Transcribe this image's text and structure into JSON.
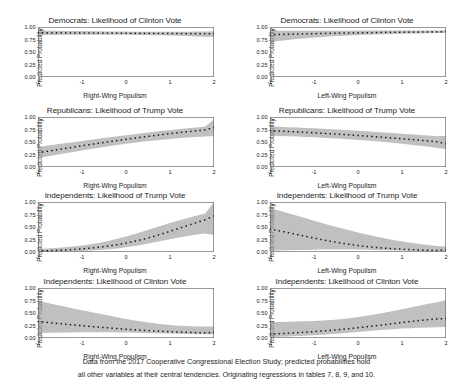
{
  "figure": {
    "width": 453,
    "height": 388,
    "band_color": "#9a9a9a",
    "line_color": "#1a1a1a",
    "frame_color": "#6e6e6e",
    "background": "#ffffff"
  },
  "caption": {
    "line1": "Data from the 2017 Cooperative Congressional Election Study; predicted probabilities hold",
    "line2": "all other variables at their central tendencies. Originating regressions in tables 7, 8, 9, and 10."
  },
  "axis": {
    "ylabel": "Predicted Probability",
    "yticks": [
      "1.00",
      "0.75",
      "0.50",
      "0.25",
      "0.00"
    ],
    "ytickvals": [
      1.0,
      0.75,
      0.5,
      0.25,
      0.0
    ],
    "ylim": [
      0,
      1
    ],
    "xticks": [
      "-2",
      "-1",
      "0",
      "1",
      "2"
    ],
    "xtickvals": [
      -2,
      -1,
      0,
      1,
      2
    ],
    "xlim": [
      -2,
      2
    ],
    "xlabel_right": "Right-Wing Populism",
    "xlabel_left": "Left-Wing Populism"
  },
  "chart_data": [
    {
      "id": "dem-clinton-rwp",
      "type": "line",
      "title": "Democrats: Likelihood of Clinton Vote",
      "xlabel": "Right-Wing Populism",
      "ylabel": "Predicted Probability",
      "xlim": [
        -2,
        2
      ],
      "ylim": [
        0,
        1
      ],
      "grid": false,
      "legend": "none",
      "x": [
        -2,
        -1.8,
        -1.6,
        -1.4,
        -1.2,
        -1,
        -0.8,
        -0.6,
        -0.4,
        -0.2,
        0,
        0.2,
        0.4,
        0.6,
        0.8,
        1,
        1.2,
        1.4,
        1.6,
        1.8,
        2
      ],
      "series": [
        {
          "name": "Predicted probability",
          "style": "dotted-marker",
          "values": [
            0.885,
            0.884,
            0.883,
            0.882,
            0.881,
            0.88,
            0.879,
            0.878,
            0.877,
            0.876,
            0.875,
            0.874,
            0.873,
            0.872,
            0.871,
            0.87,
            0.869,
            0.868,
            0.867,
            0.866,
            0.865
          ]
        },
        {
          "name": "95% CI lower",
          "style": "band",
          "values": [
            0.84,
            0.841,
            0.842,
            0.843,
            0.844,
            0.845,
            0.846,
            0.846,
            0.846,
            0.845,
            0.844,
            0.842,
            0.84,
            0.837,
            0.833,
            0.829,
            0.824,
            0.818,
            0.812,
            0.805,
            0.798
          ]
        },
        {
          "name": "95% CI upper",
          "style": "band",
          "values": [
            0.925,
            0.924,
            0.923,
            0.922,
            0.92,
            0.918,
            0.916,
            0.914,
            0.912,
            0.91,
            0.908,
            0.907,
            0.906,
            0.905,
            0.905,
            0.905,
            0.906,
            0.907,
            0.909,
            0.911,
            0.914
          ]
        }
      ]
    },
    {
      "id": "dem-clinton-lwp",
      "type": "line",
      "title": "Democrats: Likelihood of Clinton Vote",
      "xlabel": "Left-Wing Populism",
      "ylabel": "Predicted Probability",
      "xlim": [
        -2,
        2
      ],
      "ylim": [
        0,
        1
      ],
      "grid": false,
      "legend": "none",
      "x": [
        -2,
        -1.8,
        -1.6,
        -1.4,
        -1.2,
        -1,
        -0.8,
        -0.6,
        -0.4,
        -0.2,
        0,
        0.2,
        0.4,
        0.6,
        0.8,
        1,
        1.2,
        1.4,
        1.6,
        1.8,
        2
      ],
      "series": [
        {
          "name": "Predicted probability",
          "style": "dotted-marker",
          "values": [
            0.845,
            0.85,
            0.855,
            0.859,
            0.863,
            0.867,
            0.871,
            0.874,
            0.877,
            0.88,
            0.883,
            0.886,
            0.888,
            0.891,
            0.893,
            0.895,
            0.897,
            0.899,
            0.901,
            0.903,
            0.905
          ]
        },
        {
          "name": "95% CI lower",
          "style": "band",
          "values": [
            0.7,
            0.722,
            0.742,
            0.76,
            0.776,
            0.79,
            0.802,
            0.813,
            0.822,
            0.83,
            0.838,
            0.845,
            0.851,
            0.856,
            0.861,
            0.865,
            0.869,
            0.872,
            0.875,
            0.878,
            0.88
          ]
        },
        {
          "name": "95% CI upper",
          "style": "band",
          "values": [
            0.925,
            0.925,
            0.925,
            0.925,
            0.925,
            0.925,
            0.926,
            0.926,
            0.927,
            0.927,
            0.928,
            0.928,
            0.929,
            0.929,
            0.93,
            0.93,
            0.931,
            0.931,
            0.932,
            0.932,
            0.933
          ]
        }
      ]
    },
    {
      "id": "rep-trump-rwp",
      "type": "line",
      "title": "Republicans: Likelihood of Trump Vote",
      "xlabel": "Right-Wing Populism",
      "ylabel": "Predicted Probability",
      "xlim": [
        -2,
        2
      ],
      "ylim": [
        0,
        1
      ],
      "grid": false,
      "legend": "none",
      "x": [
        -2,
        -1.8,
        -1.6,
        -1.4,
        -1.2,
        -1,
        -0.8,
        -0.6,
        -0.4,
        -0.2,
        0,
        0.2,
        0.4,
        0.6,
        0.8,
        1,
        1.2,
        1.4,
        1.6,
        1.8,
        2
      ],
      "series": [
        {
          "name": "Predicted probability",
          "style": "dotted-marker",
          "values": [
            0.285,
            0.313,
            0.341,
            0.369,
            0.397,
            0.425,
            0.452,
            0.478,
            0.504,
            0.529,
            0.554,
            0.578,
            0.601,
            0.624,
            0.646,
            0.667,
            0.687,
            0.706,
            0.724,
            0.742,
            0.79
          ]
        },
        {
          "name": "95% CI lower",
          "style": "band",
          "values": [
            0.18,
            0.21,
            0.24,
            0.27,
            0.3,
            0.33,
            0.359,
            0.387,
            0.414,
            0.44,
            0.464,
            0.487,
            0.508,
            0.527,
            0.545,
            0.561,
            0.576,
            0.589,
            0.601,
            0.611,
            0.62
          ]
        },
        {
          "name": "95% CI upper",
          "style": "band",
          "values": [
            0.4,
            0.424,
            0.449,
            0.473,
            0.497,
            0.521,
            0.545,
            0.568,
            0.591,
            0.613,
            0.635,
            0.657,
            0.678,
            0.699,
            0.719,
            0.738,
            0.757,
            0.775,
            0.792,
            0.809,
            0.95
          ]
        }
      ]
    },
    {
      "id": "rep-trump-lwp",
      "type": "line",
      "title": "Republicans: Likelihood of Trump Vote",
      "xlabel": "Left-Wing Populism",
      "ylabel": "Predicted Probability",
      "xlim": [
        -2,
        2
      ],
      "ylim": [
        0,
        1
      ],
      "grid": false,
      "legend": "none",
      "x": [
        -2,
        -1.8,
        -1.6,
        -1.4,
        -1.2,
        -1,
        -0.8,
        -0.6,
        -0.4,
        -0.2,
        0,
        0.2,
        0.4,
        0.6,
        0.8,
        1,
        1.2,
        1.4,
        1.6,
        1.8,
        2
      ],
      "series": [
        {
          "name": "Predicted probability",
          "style": "dotted-marker",
          "values": [
            0.725,
            0.718,
            0.71,
            0.702,
            0.693,
            0.684,
            0.674,
            0.664,
            0.653,
            0.642,
            0.63,
            0.618,
            0.605,
            0.592,
            0.578,
            0.564,
            0.55,
            0.535,
            0.52,
            0.505,
            0.462
          ]
        },
        {
          "name": "95% CI lower",
          "style": "band",
          "values": [
            0.625,
            0.62,
            0.614,
            0.608,
            0.601,
            0.593,
            0.585,
            0.575,
            0.565,
            0.554,
            0.542,
            0.528,
            0.514,
            0.498,
            0.481,
            0.463,
            0.444,
            0.424,
            0.403,
            0.382,
            0.36
          ]
        },
        {
          "name": "95% CI upper",
          "style": "band",
          "values": [
            0.81,
            0.803,
            0.796,
            0.789,
            0.781,
            0.773,
            0.764,
            0.755,
            0.745,
            0.735,
            0.724,
            0.713,
            0.702,
            0.69,
            0.678,
            0.666,
            0.654,
            0.641,
            0.629,
            0.617,
            0.625
          ]
        }
      ]
    },
    {
      "id": "ind-trump-rwp",
      "type": "line",
      "title": "Independents: Likelihood of Trump Vote",
      "xlabel": "Right-Wing Populism",
      "ylabel": "Predicted Probability",
      "xlim": [
        -2,
        2
      ],
      "ylim": [
        0,
        1
      ],
      "grid": false,
      "legend": "none",
      "x": [
        -2,
        -1.8,
        -1.6,
        -1.4,
        -1.2,
        -1,
        -0.8,
        -0.6,
        -0.4,
        -0.2,
        0,
        0.2,
        0.4,
        0.6,
        0.8,
        1,
        1.2,
        1.4,
        1.6,
        1.8,
        2
      ],
      "series": [
        {
          "name": "Predicted probability",
          "style": "dotted-marker",
          "values": [
            0.02,
            0.025,
            0.032,
            0.04,
            0.05,
            0.063,
            0.078,
            0.097,
            0.119,
            0.146,
            0.178,
            0.215,
            0.257,
            0.305,
            0.357,
            0.413,
            0.471,
            0.53,
            0.588,
            0.645,
            0.72
          ]
        },
        {
          "name": "95% CI lower",
          "style": "band",
          "values": [
            0.0,
            0.002,
            0.005,
            0.009,
            0.014,
            0.02,
            0.029,
            0.04,
            0.054,
            0.072,
            0.094,
            0.12,
            0.15,
            0.183,
            0.218,
            0.254,
            0.289,
            0.322,
            0.35,
            0.372,
            0.34
          ]
        },
        {
          "name": "95% CI upper",
          "style": "band",
          "values": [
            0.065,
            0.072,
            0.082,
            0.094,
            0.11,
            0.13,
            0.155,
            0.186,
            0.222,
            0.264,
            0.311,
            0.362,
            0.416,
            0.471,
            0.526,
            0.58,
            0.632,
            0.681,
            0.727,
            0.77,
            1.0
          ]
        }
      ]
    },
    {
      "id": "ind-trump-lwp",
      "type": "line",
      "title": "Independents: Likelihood of Trump Vote",
      "xlabel": "Left-Wing Populism",
      "ylabel": "Predicted Probability",
      "xlim": [
        -2,
        2
      ],
      "ylim": [
        0,
        1
      ],
      "grid": false,
      "legend": "none",
      "x": [
        -2,
        -1.8,
        -1.6,
        -1.4,
        -1.2,
        -1,
        -0.8,
        -0.6,
        -0.4,
        -0.2,
        0,
        0.2,
        0.4,
        0.6,
        0.8,
        1,
        1.2,
        1.4,
        1.6,
        1.8,
        2
      ],
      "series": [
        {
          "name": "Predicted probability",
          "style": "dotted-marker",
          "values": [
            0.46,
            0.425,
            0.39,
            0.352,
            0.315,
            0.278,
            0.243,
            0.21,
            0.18,
            0.153,
            0.129,
            0.109,
            0.091,
            0.077,
            0.065,
            0.055,
            0.047,
            0.04,
            0.034,
            0.03,
            0.04
          ]
        },
        {
          "name": "95% CI lower",
          "style": "band",
          "values": [
            0.03,
            0.032,
            0.035,
            0.038,
            0.042,
            0.046,
            0.049,
            0.051,
            0.052,
            0.051,
            0.049,
            0.046,
            0.042,
            0.037,
            0.032,
            0.028,
            0.024,
            0.02,
            0.017,
            0.014,
            0.012
          ]
        },
        {
          "name": "95% CI upper",
          "style": "band",
          "values": [
            0.88,
            0.83,
            0.78,
            0.729,
            0.678,
            0.627,
            0.576,
            0.527,
            0.479,
            0.433,
            0.39,
            0.348,
            0.31,
            0.274,
            0.242,
            0.212,
            0.186,
            0.162,
            0.141,
            0.122,
            0.11
          ]
        }
      ]
    },
    {
      "id": "ind-clinton-rwp",
      "type": "line",
      "title": "Independents: Likelihood of Clinton Vote",
      "xlabel": "Right-Wing Populism",
      "ylabel": "Predicted Probability",
      "xlim": [
        -2,
        2
      ],
      "ylim": [
        0,
        1
      ],
      "grid": false,
      "legend": "none",
      "x": [
        -2,
        -1.8,
        -1.6,
        -1.4,
        -1.2,
        -1,
        -0.8,
        -0.6,
        -0.4,
        -0.2,
        0,
        0.2,
        0.4,
        0.6,
        0.8,
        1,
        1.2,
        1.4,
        1.6,
        1.8,
        2
      ],
      "series": [
        {
          "name": "Predicted probability",
          "style": "dotted-marker",
          "values": [
            0.33,
            0.312,
            0.295,
            0.278,
            0.262,
            0.246,
            0.231,
            0.216,
            0.202,
            0.189,
            0.176,
            0.164,
            0.153,
            0.143,
            0.134,
            0.126,
            0.119,
            0.113,
            0.108,
            0.104,
            0.11
          ]
        },
        {
          "name": "95% CI lower",
          "style": "band",
          "values": [
            0.1,
            0.103,
            0.106,
            0.109,
            0.111,
            0.113,
            0.114,
            0.114,
            0.113,
            0.111,
            0.108,
            0.105,
            0.101,
            0.097,
            0.092,
            0.088,
            0.084,
            0.08,
            0.076,
            0.073,
            0.07
          ]
        },
        {
          "name": "95% CI upper",
          "style": "band",
          "values": [
            0.74,
            0.703,
            0.666,
            0.629,
            0.592,
            0.556,
            0.52,
            0.484,
            0.449,
            0.415,
            0.382,
            0.351,
            0.323,
            0.298,
            0.277,
            0.26,
            0.247,
            0.238,
            0.232,
            0.229,
            0.228
          ]
        }
      ]
    },
    {
      "id": "ind-clinton-lwp",
      "type": "line",
      "title": "Independents: Likelihood of Clinton Vote",
      "xlabel": "Left-Wing Populism",
      "ylabel": "Predicted Probability",
      "xlim": [
        -2,
        2
      ],
      "ylim": [
        0,
        1
      ],
      "grid": false,
      "legend": "none",
      "x": [
        -2,
        -1.8,
        -1.6,
        -1.4,
        -1.2,
        -1,
        -0.8,
        -0.6,
        -0.4,
        -0.2,
        0,
        0.2,
        0.4,
        0.6,
        0.8,
        1,
        1.2,
        1.4,
        1.6,
        1.8,
        2
      ],
      "series": [
        {
          "name": "Predicted probability",
          "style": "dotted-marker",
          "values": [
            0.078,
            0.086,
            0.095,
            0.105,
            0.116,
            0.128,
            0.141,
            0.155,
            0.171,
            0.188,
            0.206,
            0.225,
            0.245,
            0.266,
            0.288,
            0.31,
            0.331,
            0.35,
            0.367,
            0.381,
            0.39
          ]
        },
        {
          "name": "95% CI lower",
          "style": "band",
          "values": [
            0.02,
            0.025,
            0.031,
            0.038,
            0.046,
            0.055,
            0.066,
            0.078,
            0.091,
            0.105,
            0.12,
            0.135,
            0.15,
            0.164,
            0.177,
            0.188,
            0.197,
            0.205,
            0.211,
            0.216,
            0.22
          ]
        },
        {
          "name": "95% CI upper",
          "style": "band",
          "values": [
            0.32,
            0.322,
            0.325,
            0.329,
            0.334,
            0.341,
            0.35,
            0.362,
            0.377,
            0.396,
            0.418,
            0.444,
            0.473,
            0.505,
            0.539,
            0.575,
            0.612,
            0.648,
            0.683,
            0.716,
            0.76
          ]
        }
      ]
    }
  ]
}
